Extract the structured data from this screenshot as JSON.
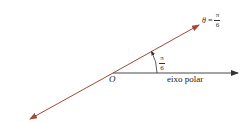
{
  "diagram": {
    "origin_label": "O",
    "axis_label": "eixo polar",
    "angle_label": {
      "numerator": "π",
      "denominator": "6"
    },
    "ray_label": {
      "variable": "θ",
      "equals": "=",
      "numerator": "π",
      "denominator": "6"
    },
    "colors": {
      "ray": "#a0483a",
      "axis": "#333333",
      "text": "#222222"
    }
  }
}
